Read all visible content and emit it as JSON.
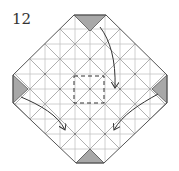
{
  "step": {
    "number": "12"
  },
  "colors": {
    "paper": "#ffffff",
    "outline": "#555555",
    "crease": "#b8b8b8",
    "colored_flap": "#a8a8a8",
    "arrow": "#333333",
    "dashed_fold": "#444444"
  },
  "diagram": {
    "shape": "octagon-diamond",
    "flaps": [
      "top",
      "left",
      "right",
      "bottom"
    ],
    "arrows": [
      {
        "from": "top-right",
        "to": "center-right",
        "type": "fold"
      },
      {
        "from": "left-flap",
        "to": "bottom-left",
        "type": "fold"
      },
      {
        "from": "right-flap",
        "to": "bottom-right",
        "type": "fold"
      }
    ],
    "dashed_square": "center"
  }
}
